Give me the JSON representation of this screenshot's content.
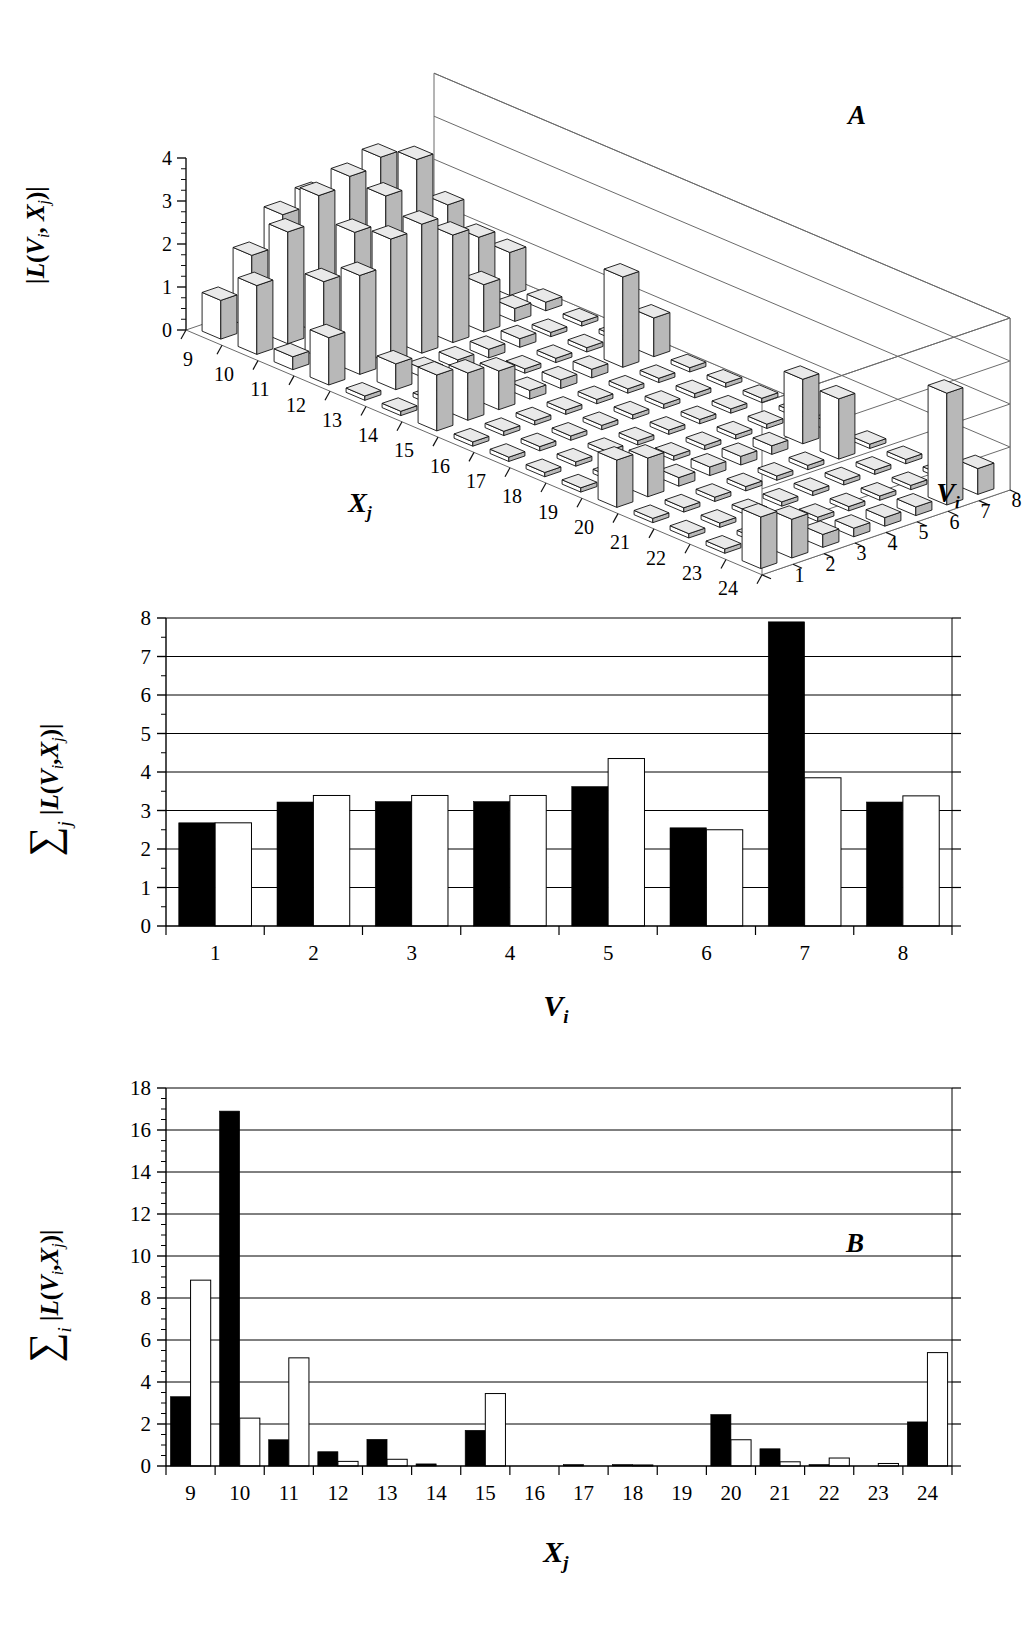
{
  "figure": {
    "panels": [
      "A",
      "B",
      "C"
    ],
    "background": "#ffffff",
    "ink": "#000000"
  },
  "panel_a": {
    "letter": "A",
    "zlabel": "|L(V, X)|",
    "zlabel_parts": {
      "prefix": "|L(",
      "v": "V",
      "vsub": "i",
      "comma": ", ",
      "x": "X",
      "xsub": "j",
      "suffix": ")|"
    },
    "xlabel": "X",
    "xlabel_sub": "j",
    "ylabel": "V",
    "ylabel_sub": "i",
    "x_ticks": [
      "9",
      "10",
      "11",
      "12",
      "13",
      "14",
      "15",
      "16",
      "17",
      "18",
      "19",
      "20",
      "21",
      "22",
      "23",
      "24"
    ],
    "y_ticks": [
      "1",
      "2",
      "3",
      "4",
      "5",
      "6",
      "7",
      "8"
    ],
    "z_ticks": [
      "0",
      "1",
      "2",
      "3",
      "4"
    ]
  },
  "panel_b": {
    "letter": "B",
    "ylabel_sigma": "∑",
    "ylabel_sigma_sub": "j",
    "ylabel_body": "|L(V,X)|",
    "xlabel": "V",
    "xlabel_sub": "i",
    "y_ticks": [
      "0",
      "1",
      "2",
      "3",
      "4",
      "5",
      "6",
      "7",
      "8"
    ],
    "x_ticks": [
      "1",
      "2",
      "3",
      "4",
      "5",
      "6",
      "7",
      "8"
    ]
  },
  "panel_c": {
    "letter": "C",
    "ylabel_sigma": "∑",
    "ylabel_sigma_sub": "i",
    "ylabel_body": "|L(V,X)|",
    "xlabel": "X",
    "xlabel_sub": "j",
    "y_ticks": [
      "0",
      "2",
      "4",
      "6",
      "8",
      "10",
      "12",
      "14",
      "16",
      "18"
    ],
    "x_ticks": [
      "9",
      "10",
      "11",
      "12",
      "13",
      "14",
      "15",
      "16",
      "17",
      "18",
      "19",
      "20",
      "21",
      "22",
      "23",
      "24"
    ]
  },
  "chart_data": [
    {
      "id": "A",
      "type": "bar",
      "title": "A",
      "projection": "3d-surface-bars",
      "xlabel": "Xj",
      "ylabel": "Vi",
      "zlabel": "|L(Vi, Xj)|",
      "x": [
        9,
        10,
        11,
        12,
        13,
        14,
        15,
        16,
        17,
        18,
        19,
        20,
        21,
        22,
        23,
        24
      ],
      "y": [
        1,
        2,
        3,
        4,
        5,
        6,
        7,
        8
      ],
      "zlim": [
        0,
        4
      ],
      "grid": true,
      "note": "z = |L(Vi,Xj)|; rows indexed by Vi (1 front .. 8 back), columns by Xj (9 left .. 24 right)",
      "z_matrix": [
        [
          0.9,
          1.6,
          0.3,
          1.1,
          0.1,
          0.1,
          1.3,
          0.1,
          0.1,
          0.1,
          0.1,
          1.1,
          0.1,
          0.1,
          0.1,
          1.2
        ],
        [
          1.7,
          2.6,
          1.8,
          2.3,
          0.6,
          0.1,
          1.1,
          0.1,
          0.1,
          0.1,
          0.1,
          0.9,
          0.1,
          0.1,
          0.1,
          0.9
        ],
        [
          2.4,
          3.2,
          2.7,
          2.9,
          0.2,
          0.1,
          0.9,
          0.1,
          0.1,
          0.1,
          0.1,
          0.2,
          0.1,
          0.1,
          0.1,
          0.3
        ],
        [
          2.6,
          3.4,
          3.3,
          3.0,
          0.2,
          0.1,
          0.2,
          0.1,
          0.1,
          0.1,
          0.1,
          0.2,
          0.1,
          0.1,
          0.1,
          0.2
        ],
        [
          2.1,
          3.6,
          3.9,
          2.5,
          0.2,
          0.1,
          0.2,
          0.1,
          0.1,
          0.1,
          0.1,
          0.2,
          0.1,
          0.1,
          0.1,
          0.2
        ],
        [
          1.1,
          2.3,
          2.6,
          1.1,
          0.2,
          0.1,
          0.2,
          0.1,
          0.1,
          0.1,
          0.1,
          0.2,
          0.1,
          0.1,
          0.1,
          0.2
        ],
        [
          0.4,
          1.3,
          1.6,
          0.3,
          0.1,
          0.1,
          2.1,
          0.1,
          0.1,
          0.1,
          0.1,
          1.5,
          1.4,
          0.1,
          0.1,
          2.6
        ],
        [
          0.2,
          0.5,
          1.0,
          0.2,
          0.1,
          0.1,
          0.9,
          0.1,
          0.1,
          0.1,
          0.1,
          0.2,
          0.1,
          0.1,
          0.1,
          0.6
        ]
      ]
    },
    {
      "id": "B",
      "type": "bar",
      "title": "B",
      "xlabel": "Vi",
      "ylabel": "∑j |L(Vi,Xj)|",
      "ylim": [
        0,
        8
      ],
      "yticks": [
        0,
        1,
        2,
        3,
        4,
        5,
        6,
        7,
        8
      ],
      "grid": true,
      "categories": [
        "1",
        "2",
        "3",
        "4",
        "5",
        "6",
        "7",
        "8"
      ],
      "series": [
        {
          "name": "filled",
          "fill": "#000000",
          "values": [
            2.68,
            3.22,
            3.23,
            3.23,
            3.62,
            2.55,
            7.9,
            3.22
          ]
        },
        {
          "name": "open",
          "fill": "#ffffff",
          "values": [
            2.68,
            3.39,
            3.39,
            3.39,
            4.35,
            2.5,
            3.85,
            3.38
          ]
        }
      ]
    },
    {
      "id": "C",
      "type": "bar",
      "title": "C",
      "xlabel": "Xj",
      "ylabel": "∑i |L(Vi,Xj)|",
      "ylim": [
        0,
        18
      ],
      "yticks": [
        0,
        2,
        4,
        6,
        8,
        10,
        12,
        14,
        16,
        18
      ],
      "grid": true,
      "categories": [
        "9",
        "10",
        "11",
        "12",
        "13",
        "14",
        "15",
        "16",
        "17",
        "18",
        "19",
        "20",
        "21",
        "22",
        "23",
        "24"
      ],
      "series": [
        {
          "name": "filled",
          "fill": "#000000",
          "values": [
            3.3,
            16.9,
            1.25,
            0.68,
            1.27,
            0.1,
            1.7,
            0.0,
            0.07,
            0.07,
            0.0,
            2.45,
            0.82,
            0.07,
            0.0,
            2.1
          ]
        },
        {
          "name": "open",
          "fill": "#ffffff",
          "values": [
            8.85,
            2.28,
            5.15,
            0.22,
            0.32,
            0.0,
            3.45,
            0.0,
            0.0,
            0.05,
            0.0,
            1.25,
            0.2,
            0.38,
            0.12,
            5.4
          ]
        }
      ]
    }
  ]
}
